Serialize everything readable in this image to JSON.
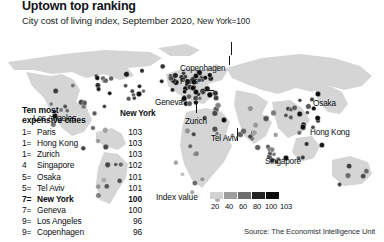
{
  "header": {
    "title": "Uptown top ranking",
    "subtitle_main": "City cost of living index, September 2020,",
    "subtitle_ref": "New York=100"
  },
  "ranking": {
    "heading_line1": "Ten most",
    "heading_line2": "expensive cities",
    "rows": [
      {
        "rank": "1=",
        "city": "Paris",
        "value": "103",
        "highlight": false
      },
      {
        "rank": "1=",
        "city": "Hong Kong",
        "value": "103",
        "highlight": false
      },
      {
        "rank": "1=",
        "city": "Zurich",
        "value": "103",
        "highlight": false
      },
      {
        "rank": "4",
        "city": "Singapore",
        "value": "102",
        "highlight": false
      },
      {
        "rank": "5=",
        "city": "Osaka",
        "value": "101",
        "highlight": false
      },
      {
        "rank": "5=",
        "city": "Tel Aviv",
        "value": "101",
        "highlight": false
      },
      {
        "rank": "7=",
        "city": "New York",
        "value": "100",
        "highlight": true
      },
      {
        "rank": "7=",
        "city": "Geneva",
        "value": "100",
        "highlight": false
      },
      {
        "rank": "9=",
        "city": "Los Angeles",
        "value": "96",
        "highlight": false
      },
      {
        "rank": "9=",
        "city": "Copenhagen",
        "value": "96",
        "highlight": false
      }
    ]
  },
  "map_labels": [
    {
      "name": "Los Angeles",
      "text": "Los Angeles",
      "x": 33,
      "y": 87,
      "bold": false
    },
    {
      "name": "New York",
      "text": "New York",
      "x": 120,
      "y": 82,
      "bold": true
    },
    {
      "name": "Copenhagen",
      "text": "Copenhagen",
      "x": 180,
      "y": 37,
      "bold": false
    },
    {
      "name": "Paris",
      "text": "Paris",
      "x": 180,
      "y": 50,
      "bold": false
    },
    {
      "name": "Geneva",
      "text": "Geneva",
      "x": 155,
      "y": 71,
      "bold": false
    },
    {
      "name": "Zurich",
      "text": "Zurich",
      "x": 185,
      "y": 90,
      "bold": false
    },
    {
      "name": "Tel Aviv",
      "text": "Tel Aviv",
      "x": 211,
      "y": 107,
      "bold": false
    },
    {
      "name": "Singapore",
      "text": "Singapore",
      "x": 265,
      "y": 130,
      "bold": false
    },
    {
      "name": "Osaka",
      "text": "Osaka",
      "x": 313,
      "y": 72,
      "bold": false
    },
    {
      "name": "Hong Kong",
      "text": "Hong Kong",
      "x": 310,
      "y": 101,
      "bold": false
    }
  ],
  "legend": {
    "label": "Index value",
    "swatch_colors": [
      "#d2d2d2",
      "#9e9e9e",
      "#6e6e6e",
      "#242424",
      "#0d0d0d"
    ],
    "ticks": [
      "20",
      "40",
      "60",
      "80",
      "100",
      "103"
    ]
  },
  "source": "Source: The Economist Intelligence Unit",
  "chart_data": {
    "type": "map",
    "title": "Uptown top ranking",
    "subtitle": "City cost of living index, September 2020, New York=100",
    "metric": "Cost of living index (New York = 100)",
    "scale_min": 20,
    "scale_max": 103,
    "legend_breaks": [
      20,
      40,
      60,
      80,
      100,
      103
    ],
    "ranked_cities": [
      {
        "rank": "1=",
        "city": "Paris",
        "index": 103
      },
      {
        "rank": "1=",
        "city": "Hong Kong",
        "index": 103
      },
      {
        "rank": "1=",
        "city": "Zurich",
        "index": 103
      },
      {
        "rank": "4",
        "city": "Singapore",
        "index": 102
      },
      {
        "rank": "5=",
        "city": "Osaka",
        "index": 101
      },
      {
        "rank": "5=",
        "city": "Tel Aviv",
        "index": 101
      },
      {
        "rank": "7=",
        "city": "New York",
        "index": 100
      },
      {
        "rank": "7=",
        "city": "Geneva",
        "index": 100
      },
      {
        "rank": "9=",
        "city": "Los Angeles",
        "index": 96
      },
      {
        "rank": "9=",
        "city": "Copenhagen",
        "index": 96
      }
    ],
    "labelled_on_map": [
      "Los Angeles",
      "New York",
      "Copenhagen",
      "Paris",
      "Geneva",
      "Zurich",
      "Tel Aviv",
      "Singapore",
      "Osaka",
      "Hong Kong"
    ],
    "source": "The Economist Intelligence Unit"
  },
  "map_geometry": {
    "land_color": "#d5d5d5",
    "ocean_color": "#ffffff",
    "land_paths": [
      "M8,34 L64,26 L104,22 L150,24 L162,30 L150,38 L128,40 L134,48 L120,52 L104,46 L86,50 L72,44 L52,46 L34,42 L14,42 Z",
      "M26,44 L50,48 L62,46 L74,52 L80,62 L76,74 L86,78 L92,92 L84,104 L72,108 L62,100 L52,86 L44,70 L32,58 Z",
      "M96,104 L112,100 L122,106 L126,116 L118,122 L104,118 L96,112 Z",
      "M104,124 L118,126 L128,136 L126,150 L118,162 L110,176 L100,172 L96,156 L98,140 Z",
      "M166,46 L186,40 L204,42 L216,36 L228,42 L222,52 L208,56 L214,66 L204,76 L192,74 L178,66 L168,58 Z",
      "M186,84 L206,80 L222,84 L230,94 L226,106 L232,118 L224,134 L212,148 L202,160 L192,152 L184,136 L180,118 L182,100 Z",
      "M226,40 L262,30 L300,26 L334,30 L360,38 L372,48 L362,58 L344,62 L330,58 L312,64 L296,60 L278,66 L262,62 L246,56 L232,50 Z",
      "M236,62 L256,66 L268,74 L262,86 L272,94 L266,108 L254,116 L244,108 L238,92 L234,76 Z",
      "M272,74 L290,72 L302,80 L310,92 L302,104 L288,110 L278,100 L274,86 Z",
      "M296,110 L312,108 L320,118 L314,130 L300,134 L292,124 Z",
      "M316,62 L330,58 L342,64 L348,76 L340,86 L328,84 L318,74 Z",
      "M332,132 L350,128 L368,134 L372,146 L362,156 L344,158 L332,148 Z",
      "M158,20 L186,16 L200,22 L190,28 L170,28 Z"
    ]
  }
}
